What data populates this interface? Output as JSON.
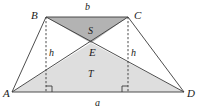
{
  "figure": {
    "kind": "geometry-diagram",
    "canvas": {
      "width": 200,
      "height": 110
    },
    "colors": {
      "stroke": "#3a3a3a",
      "shade_dark": "#b3b3b3",
      "shade_light": "#dedede",
      "background": "#ffffff",
      "text": "#1a1a1a"
    },
    "points": {
      "A": {
        "x": 12,
        "y": 92
      },
      "B": {
        "x": 46,
        "y": 17
      },
      "C": {
        "x": 128,
        "y": 17
      },
      "D": {
        "x": 184,
        "y": 92
      },
      "E": {
        "x": 91,
        "y": 43
      },
      "F": {
        "x": 46,
        "y": 92
      },
      "G": {
        "x": 128,
        "y": 92
      }
    },
    "regions": [
      {
        "name": "triangle-BEC",
        "label": "S",
        "fill": "shade_dark",
        "label_x": 91,
        "label_y": 26
      },
      {
        "name": "triangle-AED",
        "label": "T",
        "fill": "shade_light",
        "label_x": 91,
        "label_y": 69
      }
    ],
    "vertex_labels": [
      {
        "name": "A",
        "text": "A",
        "x": 3,
        "y": 88
      },
      {
        "name": "B",
        "text": "B",
        "x": 31,
        "y": 10
      },
      {
        "name": "C",
        "text": "C",
        "x": 134,
        "y": 10
      },
      {
        "name": "D",
        "text": "D",
        "x": 187,
        "y": 88
      },
      {
        "name": "E",
        "text": "E",
        "x": 89,
        "y": 47
      }
    ],
    "side_labels": [
      {
        "name": "b",
        "text": "b",
        "x": 85,
        "y": 2,
        "of": "top-side-BC"
      },
      {
        "name": "a",
        "text": "a",
        "x": 95,
        "y": 98,
        "of": "bottom-side-AD"
      },
      {
        "name": "h-left",
        "text": "h",
        "x": 49,
        "y": 48,
        "of": "left-height"
      },
      {
        "name": "h-right",
        "text": "h",
        "x": 131,
        "y": 48,
        "of": "right-height"
      }
    ],
    "heights": [
      {
        "name": "left-height",
        "x": 46,
        "y1": 17,
        "y2": 92
      },
      {
        "name": "right-height",
        "x": 128,
        "y1": 17,
        "y2": 92
      }
    ],
    "right_angles": [
      {
        "name": "right-angle-left",
        "x": 46,
        "y": 92,
        "dir": 1
      },
      {
        "name": "right-angle-right",
        "x": 128,
        "y": 92,
        "dir": -1
      }
    ]
  }
}
